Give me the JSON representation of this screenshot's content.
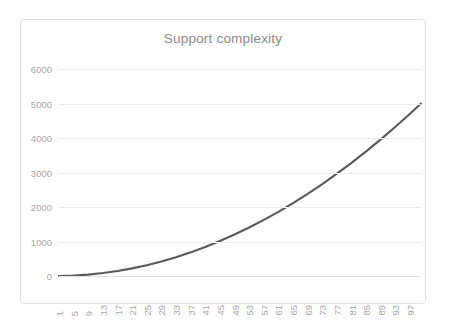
{
  "chart_data": {
    "type": "line",
    "title": "Support complexity",
    "xlabel": "",
    "ylabel": "",
    "grid": true,
    "legend": "none",
    "line_color": "#595959",
    "title_color": "#8a8a8a",
    "tick_color": "#a6a6a6",
    "gridline_color": "#ececed",
    "border_color": "#e2e2e2",
    "xlim": [
      1,
      100
    ],
    "ylim": [
      0,
      6000
    ],
    "y_ticks": [
      0,
      1000,
      2000,
      3000,
      4000,
      5000,
      6000
    ],
    "y_tick_labels": [
      "0",
      "1000",
      "2000",
      "3000",
      "4000",
      "5000",
      "6000"
    ],
    "x_tick_labels": [
      "1",
      "5",
      "9",
      "13",
      "17",
      "21",
      "25",
      "29",
      "33",
      "37",
      "41",
      "45",
      "49",
      "53",
      "57",
      "61",
      "65",
      "69",
      "73",
      "77",
      "81",
      "85",
      "89",
      "93",
      "97"
    ],
    "series": [
      {
        "name": "Support complexity",
        "x": [
          1,
          5,
          9,
          13,
          17,
          21,
          25,
          29,
          33,
          37,
          41,
          45,
          49,
          53,
          57,
          61,
          65,
          69,
          73,
          77,
          81,
          85,
          89,
          93,
          97,
          100
        ],
        "values": [
          1,
          13,
          41,
          85,
          145,
          221,
          313,
          421,
          545,
          685,
          841,
          1013,
          1201,
          1405,
          1625,
          1861,
          2113,
          2381,
          2665,
          2965,
          3281,
          3613,
          3961,
          4325,
          4705,
          5000
        ]
      }
    ]
  }
}
